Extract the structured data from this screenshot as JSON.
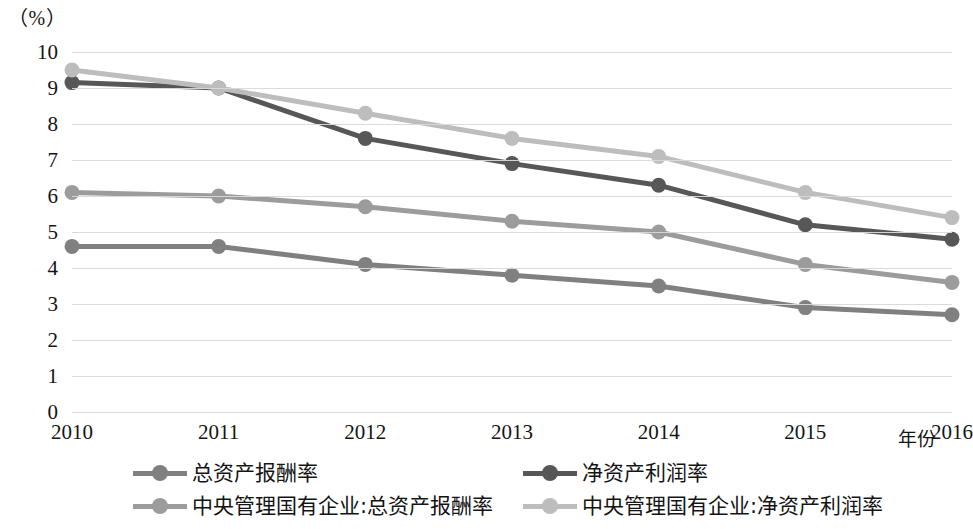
{
  "axis": {
    "unit_label": "（%）",
    "x_title": "年份"
  },
  "chart_data": {
    "type": "line",
    "title": "",
    "subtitle": "",
    "xlabel": "年份",
    "ylabel": "（%）",
    "categories": [
      "2010",
      "2011",
      "2012",
      "2013",
      "2014",
      "2015",
      "2016"
    ],
    "x": [
      2010,
      2011,
      2012,
      2013,
      2014,
      2015,
      2016
    ],
    "ylim": [
      0,
      10
    ],
    "yticks": [
      "0",
      "1",
      "2",
      "3",
      "4",
      "5",
      "6",
      "7",
      "8",
      "9",
      "10"
    ],
    "ytick_values": [
      0,
      1,
      2,
      3,
      4,
      5,
      6,
      7,
      8,
      9,
      10
    ],
    "grid": true,
    "legend_position": "bottom",
    "series": [
      {
        "name": "总资产报酬率",
        "color": "#808080",
        "values": [
          4.6,
          4.6,
          4.1,
          3.8,
          3.5,
          2.9,
          2.7
        ]
      },
      {
        "name": "净资产利润率",
        "color": "#575757",
        "values": [
          9.15,
          9.0,
          7.6,
          6.9,
          6.3,
          5.2,
          4.8
        ]
      },
      {
        "name": "中央管理国有企业:总资产报酬率",
        "color": "#9c9c9c",
        "values": [
          6.1,
          6.0,
          5.7,
          5.3,
          5.0,
          4.1,
          3.6
        ]
      },
      {
        "name": "中央管理国有企业:净资产利润率",
        "color": "#bdbdbd",
        "values": [
          9.5,
          9.0,
          8.3,
          7.6,
          7.1,
          6.1,
          5.4
        ]
      }
    ]
  },
  "legend": {
    "entries": [
      {
        "label": "总资产报酬率",
        "color": "#808080"
      },
      {
        "label": "净资产利润率",
        "color": "#575757"
      },
      {
        "label": "中央管理国有企业:总资产报酬率",
        "color": "#9c9c9c"
      },
      {
        "label": "中央管理国有企业:净资产利润率",
        "color": "#bdbdbd"
      }
    ]
  }
}
